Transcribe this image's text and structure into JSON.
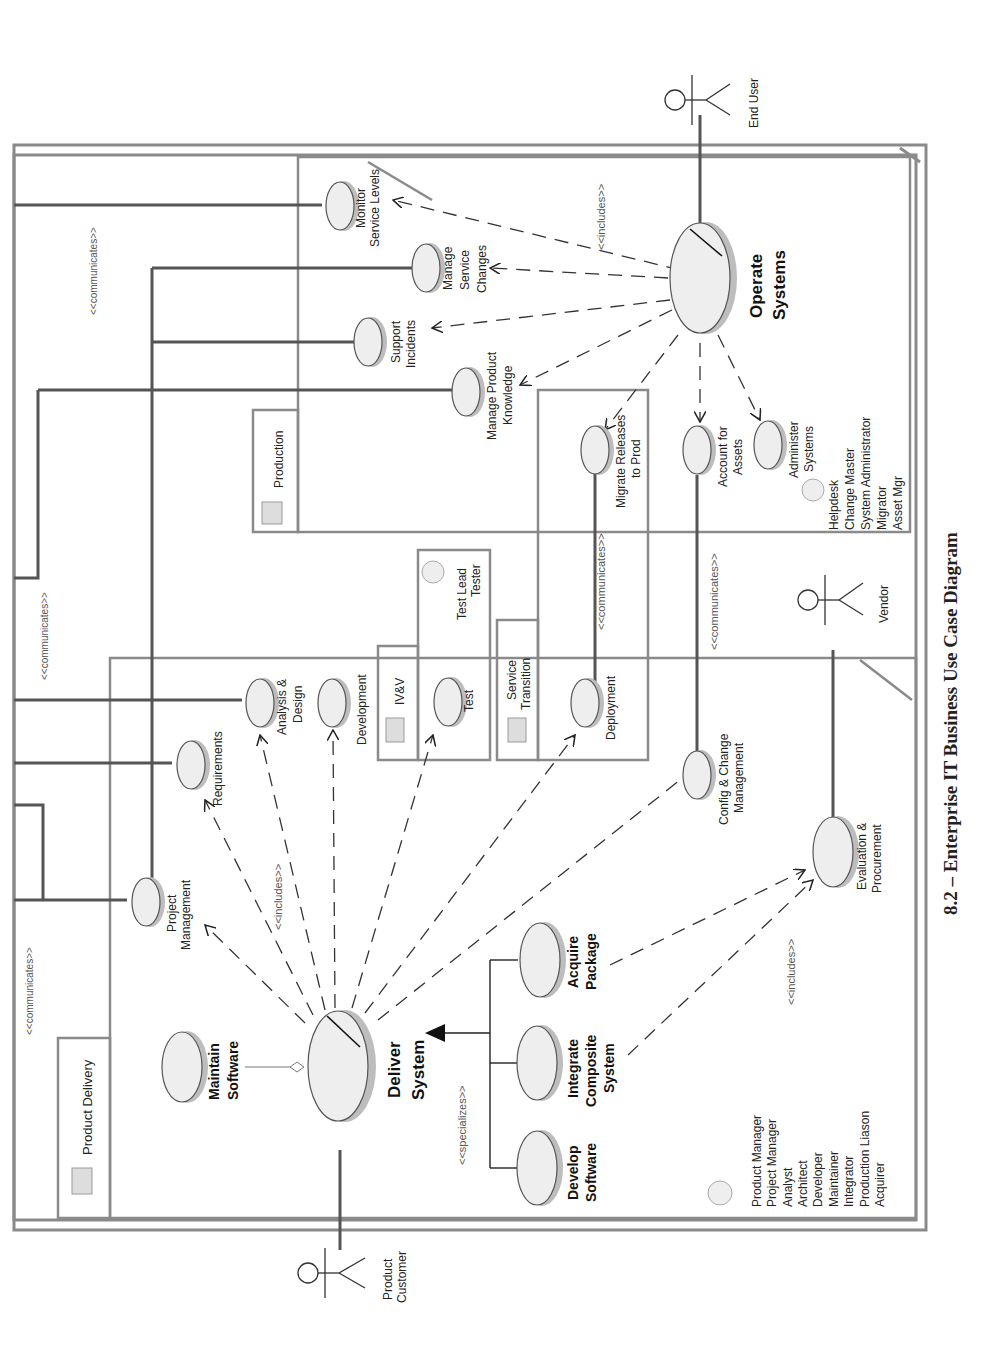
{
  "title": "8.2 – Enterprise IT Business Use Case Diagram",
  "packages": {
    "production": "Production",
    "product_delivery": "Product Delivery",
    "ivv": "IV&V",
    "service_transition_1": "Service",
    "service_transition_2": "Transition"
  },
  "actors": {
    "end_user": "End User",
    "vendor": "Vendor",
    "product_customer_1": "Product",
    "product_customer_2": "Customer"
  },
  "stereotypes": {
    "communicates": "<<communicates>>",
    "includes": "<<includes>>",
    "specializes": "<<specializes>>"
  },
  "use_cases": {
    "monitor_1": "Monitor",
    "monitor_2": "Service Levels",
    "manage_changes_1": "Manage",
    "manage_changes_2": "Service",
    "manage_changes_3": "Changes",
    "support_1": "Support",
    "support_2": "Incidents",
    "knowledge_1": "Manage Product",
    "knowledge_2": "Knowledge",
    "operate_1": "Operate",
    "operate_2": "Systems",
    "migrate_1": "Migrate Releases",
    "migrate_2": "to Prod",
    "assets_1": "Account for",
    "assets_2": "Assets",
    "administer_1": "Administer",
    "administer_2": "Systems",
    "deployment": "Deployment",
    "test": "Test",
    "development": "Development",
    "analysis_1": "Analysis &",
    "analysis_2": "Design",
    "requirements": "Requirements",
    "project_mgmt_1": "Project",
    "project_mgmt_2": "Management",
    "config_1": "Config & Change",
    "config_2": "Management",
    "evaluation_1": "Evaluation &",
    "evaluation_2": "Procurement",
    "maintain_1": "Maintain",
    "maintain_2": "Software",
    "deliver_1": "Deliver",
    "deliver_2": "System",
    "develop_1": "Develop",
    "develop_2": "Software",
    "integrate_1": "Integrate",
    "integrate_2": "Composite",
    "integrate_3": "System",
    "acquire_1": "Acquire",
    "acquire_2": "Package"
  },
  "worker_roles": {
    "production": [
      "Helpdesk",
      "Change Master",
      "System Administrator",
      "Migrator",
      "Asset Mgr"
    ],
    "ivv": [
      "Test Lead",
      "Tester"
    ],
    "product_delivery": [
      "Product Manager",
      "Project Manager",
      "Analyst",
      "Architect",
      "Developer",
      "Maintainer",
      "Integrator",
      "Production Liason",
      "Acquirer"
    ]
  }
}
